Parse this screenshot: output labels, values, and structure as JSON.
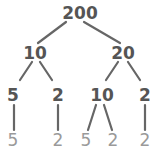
{
  "colors": {
    "edge": "#666666",
    "node": "#555555",
    "leaf": "#9a9a9a"
  },
  "nodes": [
    {
      "id": "n200",
      "label": "200",
      "x": 80,
      "y": 13,
      "leaf": false
    },
    {
      "id": "n10",
      "label": "10",
      "x": 35,
      "y": 53,
      "leaf": false
    },
    {
      "id": "n20",
      "label": "20",
      "x": 123,
      "y": 53,
      "leaf": false
    },
    {
      "id": "n5a",
      "label": "5",
      "x": 13,
      "y": 95,
      "leaf": false
    },
    {
      "id": "n2a",
      "label": "2",
      "x": 58,
      "y": 95,
      "leaf": false
    },
    {
      "id": "n10b",
      "label": "10",
      "x": 102,
      "y": 95,
      "leaf": false
    },
    {
      "id": "n2b",
      "label": "2",
      "x": 145,
      "y": 95,
      "leaf": false
    },
    {
      "id": "l5a",
      "label": "5",
      "x": 13,
      "y": 140,
      "leaf": true
    },
    {
      "id": "l2a",
      "label": "2",
      "x": 58,
      "y": 140,
      "leaf": true
    },
    {
      "id": "l5b",
      "label": "5",
      "x": 86,
      "y": 140,
      "leaf": true
    },
    {
      "id": "l2b",
      "label": "2",
      "x": 113,
      "y": 140,
      "leaf": true
    },
    {
      "id": "l2c",
      "label": "2",
      "x": 145,
      "y": 140,
      "leaf": true
    }
  ],
  "edges": [
    {
      "from": "n200",
      "to": "n10",
      "x1": 66,
      "y1": 22,
      "x2": 38,
      "y2": 43
    },
    {
      "from": "n200",
      "to": "n20",
      "x1": 84,
      "y1": 22,
      "x2": 120,
      "y2": 43
    },
    {
      "from": "n10",
      "to": "n5a",
      "x1": 32,
      "y1": 62,
      "x2": 20,
      "y2": 80
    },
    {
      "from": "n10",
      "to": "n2a",
      "x1": 40,
      "y1": 62,
      "x2": 52,
      "y2": 80
    },
    {
      "from": "n20",
      "to": "n10b",
      "x1": 118,
      "y1": 62,
      "x2": 106,
      "y2": 80
    },
    {
      "from": "n20",
      "to": "n2b",
      "x1": 128,
      "y1": 62,
      "x2": 140,
      "y2": 80
    },
    {
      "from": "n5a",
      "to": "l5a",
      "x1": 14,
      "y1": 105,
      "x2": 14,
      "y2": 130
    },
    {
      "from": "n2a",
      "to": "l2a",
      "x1": 58,
      "y1": 105,
      "x2": 58,
      "y2": 130
    },
    {
      "from": "n10b",
      "to": "l5b",
      "x1": 96,
      "y1": 105,
      "x2": 88,
      "y2": 130
    },
    {
      "from": "n10b",
      "to": "l2b",
      "x1": 104,
      "y1": 105,
      "x2": 112,
      "y2": 130
    },
    {
      "from": "n2b",
      "to": "l2c",
      "x1": 145,
      "y1": 105,
      "x2": 145,
      "y2": 130
    }
  ]
}
